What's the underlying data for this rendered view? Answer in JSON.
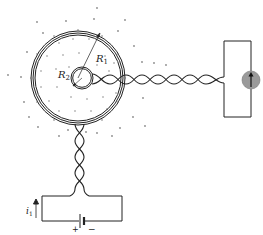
{
  "labels": {
    "outer_radius": "R",
    "outer_radius_sub": "1",
    "inner_radius": "R",
    "inner_radius_sub": "2",
    "current": "i",
    "current_sub": "1",
    "battery_plus": "+",
    "battery_minus": "−"
  },
  "components": {
    "outer_toroid": "toroidal coil with radius R1",
    "inner_loop": "small loop with radius R2",
    "galvanometer": "galvanometer",
    "battery": "battery"
  },
  "colors": {
    "line": "#222222",
    "dots": "#8a8a8a",
    "crosses": "#a8a8a8",
    "galvanometer_fill": "#9a9a9a"
  }
}
